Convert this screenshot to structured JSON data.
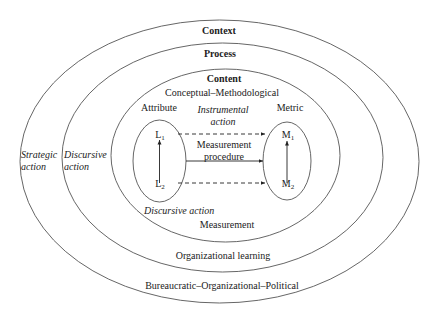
{
  "layers": {
    "context": "Context",
    "process": "Process",
    "content": "Content"
  },
  "content_domain": "Conceptual–Methodological",
  "process_domain": "Organizational learning",
  "context_domain": "Bureaucratic–Organizational–Political",
  "inner_domain": "Measurement",
  "attribute": {
    "label": "Attribute",
    "top": "L",
    "top_sub": "1",
    "bottom": "L",
    "bottom_sub": "2"
  },
  "metric": {
    "label": "Metric",
    "top": "M",
    "top_sub": "1",
    "bottom": "M",
    "bottom_sub": "2"
  },
  "arrows": {
    "instrumental_line1": "Instrumental",
    "instrumental_line2": "action",
    "procedure_line1": "Measurement",
    "procedure_line2": "procedure"
  },
  "actions": {
    "strategic_line1": "Strategic",
    "strategic_line2": "action",
    "discursive_outer_line1": "Discursive",
    "discursive_outer_line2": "action",
    "discursive_inner": "Discursive action"
  }
}
